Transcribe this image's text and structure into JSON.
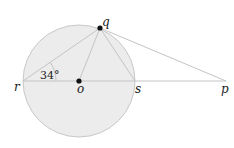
{
  "diagram": {
    "type": "geometry",
    "circle": {
      "center": "o",
      "cx": 79,
      "cy": 81,
      "r": 56,
      "fill": "#ececec",
      "stroke": "#c8c8c8"
    },
    "points": {
      "q": {
        "label": "q",
        "x": 100,
        "y": 28
      },
      "r": {
        "label": "r",
        "x": 23,
        "y": 81
      },
      "o": {
        "label": "o",
        "x": 79,
        "y": 81
      },
      "s": {
        "label": "s",
        "x": 135,
        "y": 81
      },
      "p": {
        "label": "p",
        "x": 226,
        "y": 81
      }
    },
    "segments": [
      "r-p",
      "r-q",
      "o-q",
      "q-s",
      "q-p"
    ],
    "angle": {
      "vertex": "r",
      "label": "34°"
    },
    "line_color": "#c4c4c4"
  }
}
